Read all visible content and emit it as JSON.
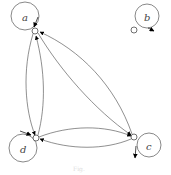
{
  "diagram": {
    "type": "directed-graph",
    "nodes": [
      {
        "id": "a",
        "label": "a"
      },
      {
        "id": "b",
        "label": "b"
      },
      {
        "id": "c",
        "label": "c"
      },
      {
        "id": "d",
        "label": "d"
      }
    ],
    "edges": [
      {
        "from": "a",
        "to": "a",
        "kind": "self-loop"
      },
      {
        "from": "b",
        "to": "b",
        "kind": "self-loop"
      },
      {
        "from": "c",
        "to": "c",
        "kind": "self-loop"
      },
      {
        "from": "d",
        "to": "d",
        "kind": "self-loop"
      },
      {
        "from": "a",
        "to": "d"
      },
      {
        "from": "d",
        "to": "a"
      },
      {
        "from": "a",
        "to": "c"
      },
      {
        "from": "c",
        "to": "a"
      },
      {
        "from": "d",
        "to": "c"
      },
      {
        "from": "c",
        "to": "d"
      }
    ],
    "caption": "Fig."
  }
}
